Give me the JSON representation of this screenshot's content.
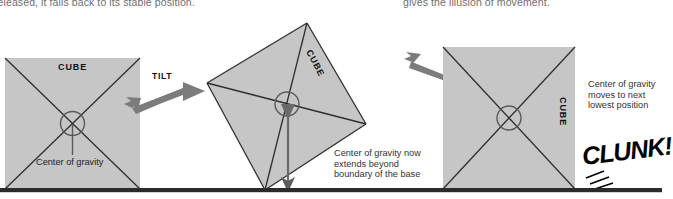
{
  "figure": {
    "title_hidden": "",
    "top_text_left": "released, it falls back to its stable position.",
    "top_text_right": "gives the illusion of movement.",
    "ground_color": "#2b2b2b",
    "cube_fill": "#c6c6c6",
    "cube_stroke": "#2f2f2f",
    "arrow_color": "#7a7a7a"
  },
  "panels": [
    {
      "id": "stable",
      "cube_label": "CUBE",
      "cog_label": "Center of gravity",
      "state": "upright-stable"
    },
    {
      "id": "tilted",
      "cube_label": "CUBE",
      "action_label": "TILT",
      "caption": "Center of gravity now\nextends beyond\nboundary of the base",
      "state": "tilted-past-tipping-point"
    },
    {
      "id": "fallen",
      "cube_label": "CUBE",
      "caption": "Center of gravity\nmoves to next\nlowest position",
      "sound_effect": "CLUNK!",
      "state": "landed-new-face"
    }
  ],
  "icons": {
    "cog_marker": "circle-cross-icon",
    "tilt_arrow": "arrow-right-icon",
    "fall_arrow": "arrow-down-right-icon",
    "gravity_arrow": "arrow-down-icon",
    "impact_lines": "impact-lines-icon"
  }
}
